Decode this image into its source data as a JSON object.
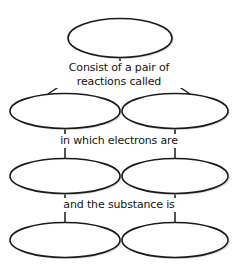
{
  "diagram": {
    "type": "concept-map",
    "background_color": "#ffffff",
    "node_fill_color": "#ffffff",
    "node_stroke_color": "#1a1a1a",
    "text_color": "#141414",
    "nodes": [
      {
        "id": "node-root",
        "label": "",
        "row": 1,
        "column": 1
      },
      {
        "id": "node-branch-left",
        "label": "",
        "row": 2,
        "column": 1
      },
      {
        "id": "node-branch-right",
        "label": "",
        "row": 2,
        "column": 2
      },
      {
        "id": "node-electron-left",
        "label": "",
        "row": 3,
        "column": 1
      },
      {
        "id": "node-electron-right",
        "label": "",
        "row": 3,
        "column": 2
      },
      {
        "id": "node-substance-left",
        "label": "",
        "row": 4,
        "column": 1
      },
      {
        "id": "node-substance-right",
        "label": "",
        "row": 4,
        "column": 2
      }
    ],
    "edge_labels": {
      "consist_of_line1": "Consist of a pair of",
      "consist_of_line2": "reactions called",
      "electrons": "in which electrons are",
      "substance": "and the substance is"
    }
  }
}
